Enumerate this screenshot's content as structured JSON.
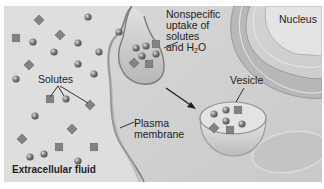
{
  "diagram": {
    "type": "pinocytosis-illustration",
    "labels": {
      "nonspecific_line1": "Nonspecific",
      "nonspecific_line2": "uptake of",
      "nonspecific_line3": "solutes",
      "nonspecific_line4_prefix": "and H",
      "nonspecific_line4_sub": "2",
      "nonspecific_line4_suffix": "O",
      "nucleus": "Nucleus",
      "solutes": "Solutes",
      "vesicle": "Vesicle",
      "plasma_membrane_line1": "Plasma",
      "plasma_membrane_line2": "membrane",
      "extracellular_fluid": "Extracellular fluid"
    },
    "colors": {
      "background": "#dcdcdc",
      "cytoplasm": "#d2d2d2",
      "membrane": "#8f8f8f",
      "solute_sphere": "#7a7a7a",
      "solute_square": "#858585",
      "nucleus_envelope": "#a9a9a9"
    }
  }
}
